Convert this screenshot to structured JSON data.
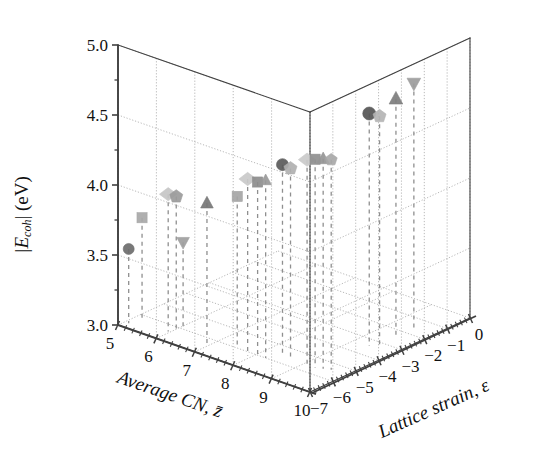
{
  "figure": {
    "kind": "3d-scatter-plot",
    "background_color": "#ffffff",
    "axis_color": "#404040",
    "grid_color": "#9a9a9a",
    "dropline_color": "#8f8f8f"
  },
  "axes": {
    "x": {
      "label": "Average CN, z̄",
      "ticks": [
        "5",
        "6",
        "7",
        "8",
        "9",
        "10"
      ],
      "range": [
        5,
        10
      ]
    },
    "y": {
      "label": "|E_coh| (eV)",
      "label_parts": {
        "bar": "|",
        "e": "E",
        "sub": "coh",
        "bar2": "|",
        "unit": "(eV)"
      },
      "ticks": [
        "3.0",
        "3.5",
        "4.0",
        "4.5",
        "5.0"
      ],
      "minor_ticks": [
        "3.25",
        "3.75",
        "4.25",
        "4.75"
      ],
      "range": [
        3.0,
        5.0
      ]
    },
    "z": {
      "label": "Lattice strain, ε",
      "ticks": [
        "−7",
        "−6",
        "−5",
        "−4",
        "−3",
        "−2",
        "−1",
        "0"
      ],
      "range": [
        -7,
        0
      ]
    }
  },
  "chart_data": {
    "type": "scatter",
    "title": "",
    "xlabel": "Average CN, z̄",
    "ylabel": "|E_coh| (eV)",
    "zlabel": "Lattice strain, ε",
    "xlim": [
      5,
      10
    ],
    "ylim": [
      3.0,
      5.0
    ],
    "zlim": [
      -7,
      0
    ],
    "grid": true,
    "legend": "none",
    "projection": "3d",
    "droplines": true,
    "marker_shapes": [
      "circle",
      "square",
      "diamond",
      "triangle-up",
      "triangle-down",
      "pentagon"
    ],
    "points": [
      {
        "id": "p01",
        "shape": "circle",
        "x": 5.1,
        "y": 3.53,
        "z": -6.7,
        "color": "#6d6d6d",
        "size": 11
      },
      {
        "id": "p02",
        "shape": "square",
        "x": 5.15,
        "y": 3.72,
        "z": -6.2,
        "color": "#a8a8a8",
        "size": 11
      },
      {
        "id": "p03",
        "shape": "diamond",
        "x": 5.95,
        "y": 3.98,
        "z": -6.4,
        "color": "#c6c6c6",
        "size": 14
      },
      {
        "id": "p04",
        "shape": "pentagon",
        "x": 6.1,
        "y": 3.97,
        "z": -6.3,
        "color": "#9b9b9b",
        "size": 13
      },
      {
        "id": "p05",
        "shape": "triangle-down",
        "x": 6.1,
        "y": 3.62,
        "z": -6.0,
        "color": "#9e9e9e",
        "size": 12
      },
      {
        "id": "p06",
        "shape": "triangle-up",
        "x": 6.9,
        "y": 4.0,
        "z": -6.3,
        "color": "#767676",
        "size": 12
      },
      {
        "id": "p07",
        "shape": "square",
        "x": 7.45,
        "y": 4.07,
        "z": -5.9,
        "color": "#a5a5a5",
        "size": 11
      },
      {
        "id": "p08",
        "shape": "diamond",
        "x": 7.9,
        "y": 4.26,
        "z": -6.2,
        "color": "#c9c9c9",
        "size": 14
      },
      {
        "id": "p09",
        "shape": "square",
        "x": 8.1,
        "y": 4.25,
        "z": -6.1,
        "color": "#8d8d8d",
        "size": 11
      },
      {
        "id": "p10",
        "shape": "triangle-up",
        "x": 8.25,
        "y": 4.27,
        "z": -6.0,
        "color": "#999999",
        "size": 11
      },
      {
        "id": "p11",
        "shape": "circle",
        "x": 8.45,
        "y": 4.37,
        "z": -5.6,
        "color": "#5b5b5b",
        "size": 12
      },
      {
        "id": "p12",
        "shape": "pentagon",
        "x": 8.6,
        "y": 4.35,
        "z": -5.5,
        "color": "#b0b0b0",
        "size": 13
      },
      {
        "id": "p13",
        "shape": "diamond",
        "x": 9.15,
        "y": 4.48,
        "z": -5.7,
        "color": "#cacaca",
        "size": 14
      },
      {
        "id": "p14",
        "shape": "square",
        "x": 9.3,
        "y": 4.49,
        "z": -5.6,
        "color": "#8f8f8f",
        "size": 11
      },
      {
        "id": "p15",
        "shape": "triangle-up",
        "x": 9.45,
        "y": 4.5,
        "z": -5.5,
        "color": "#959595",
        "size": 12
      },
      {
        "id": "p16",
        "shape": "pentagon",
        "x": 9.6,
        "y": 4.5,
        "z": -5.4,
        "color": "#a8a8a8",
        "size": 12
      },
      {
        "id": "p17",
        "shape": "circle",
        "x": 9.4,
        "y": 4.66,
        "z": -3.4,
        "color": "#555555",
        "size": 13
      },
      {
        "id": "p18",
        "shape": "pentagon",
        "x": 9.55,
        "y": 4.64,
        "z": -3.2,
        "color": "#b4b4b4",
        "size": 13
      },
      {
        "id": "p19",
        "shape": "triangle-up",
        "x": 9.5,
        "y": 4.7,
        "z": -2.4,
        "color": "#7d7d7d",
        "size": 13
      },
      {
        "id": "p20",
        "shape": "triangle-down",
        "x": 9.55,
        "y": 4.76,
        "z": -1.7,
        "color": "#9c9c9c",
        "size": 13
      }
    ]
  }
}
